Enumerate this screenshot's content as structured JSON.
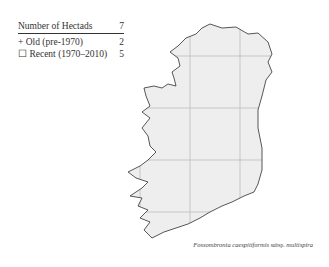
{
  "legend": {
    "title": "Number of Hectads",
    "total": "7",
    "items": [
      {
        "symbol": "+",
        "label": "Old  (pre-1970)",
        "count": "2"
      },
      {
        "symbol": "☐",
        "label": "Recent  (1970–2010)",
        "count": "5"
      }
    ]
  },
  "caption": {
    "genus_species": "Fossombronia caespitiformis",
    "rank": "subsp.",
    "infra": "multispira"
  },
  "colors": {
    "land": "#eeeeee",
    "outline": "#444444",
    "grid": "#bbbbbb"
  }
}
